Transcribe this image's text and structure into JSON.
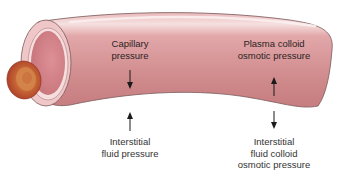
{
  "diagram": {
    "type": "capillary-pressure-forces",
    "colors": {
      "vessel_fill": "#cf8a8c",
      "vessel_highlight": "#f3d6d6",
      "vessel_inner_wall": "#e8b6b8",
      "vessel_lumen": "#d9888e",
      "vessel_outline": "#7a5b5b",
      "rbc_outer": "#b5452a",
      "rbc_inner": "#d98a4a",
      "arrow": "#1a1a1a",
      "background": "#ffffff"
    },
    "labels": {
      "capillary_pressure": {
        "line1": "Capillary",
        "line2": "pressure",
        "arrow_direction": "down"
      },
      "interstitial_fluid_pressure": {
        "line1": "Interstitial",
        "line2": "fluid pressure",
        "arrow_direction": "up"
      },
      "plasma_colloid_osmotic_pressure": {
        "line1": "Plasma colloid",
        "line2": "osmotic pressure",
        "arrow_direction": "up"
      },
      "interstitial_fluid_colloid_osmotic_pressure": {
        "line1": "Interstitial",
        "line2": "fluid colloid",
        "line3": "osmotic pressure",
        "arrow_direction": "down"
      }
    }
  }
}
